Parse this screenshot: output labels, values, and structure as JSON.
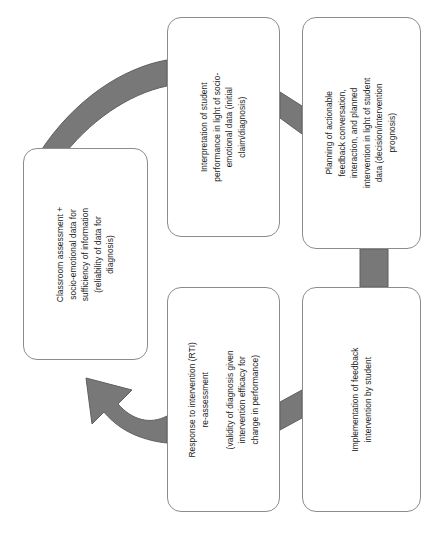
{
  "diagram": {
    "type": "cycle-flowchart",
    "colors": {
      "arrow_fill": "#787878",
      "arrow_stroke": "#5f5f5f",
      "box_border": "#8c8c8c",
      "box_fill": "#ffffff",
      "text": "#1a1a1a",
      "background": "#ffffff"
    },
    "nodes": [
      {
        "id": "classroom",
        "label": "Classroom assessment +\nsocio-emotional data for\nsufficiency of information\n(reliability of data for\ndiagnosis)"
      },
      {
        "id": "interpretation",
        "label": "Interpretation of student\nperformance in light of socio-\nemotional data (initial\nclaim/diagnosis)"
      },
      {
        "id": "planning",
        "label": "Planning of actionable\nfeedback conversation,\ninteraction, and planned\nintervention in light of student\ndata (decision/intervention\nprognosis)"
      },
      {
        "id": "rti",
        "label": "Response to intervention (RTI)\nre-assessment\n\n(validity of diagnosis given\nintervention efficacy for\nchange in performance)"
      },
      {
        "id": "implementation",
        "label": "Implementation of feedback\nintervention by student"
      }
    ],
    "connectors": [
      {
        "id": "classroom-to-interpretation",
        "from": "classroom",
        "to": "interpretation",
        "style": "curved-band"
      },
      {
        "id": "interpretation-to-planning",
        "from": "interpretation",
        "to": "planning",
        "style": "slanted-band"
      },
      {
        "id": "planning-to-implementation",
        "from": "planning",
        "to": "implementation",
        "style": "straight-band"
      },
      {
        "id": "implementation-to-rti",
        "from": "implementation",
        "to": "rti",
        "style": "slanted-band"
      },
      {
        "id": "rti-to-classroom",
        "from": "rti",
        "to": "classroom",
        "style": "curved-arrow"
      }
    ]
  }
}
